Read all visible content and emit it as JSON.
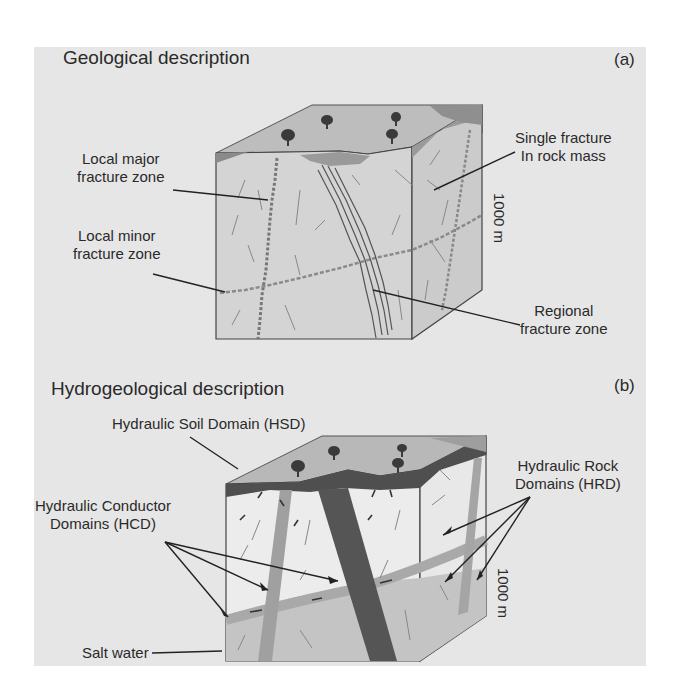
{
  "panel_a": {
    "title": "Geological description",
    "tag": "(a)",
    "labels": {
      "local_major_1": "Local major",
      "local_major_2": "fracture zone",
      "local_minor_1": "Local minor",
      "local_minor_2": "fracture zone",
      "single_1": "Single fracture",
      "single_2": "In rock mass",
      "regional_1": "Regional",
      "regional_2": "fracture zone",
      "depth": "1000 m"
    }
  },
  "panel_b": {
    "title": "Hydrogeological description",
    "tag": "(b)",
    "labels": {
      "hsd": "Hydraulic Soil Domain (HSD)",
      "hcd_1": "Hydraulic Conductor",
      "hcd_2": "Domains  (HCD)",
      "hrd_1": "Hydraulic Rock",
      "hrd_2": "Domains (HRD)",
      "salt": "Salt  water",
      "depth": "1000 m"
    }
  },
  "colors": {
    "background": "#e6e6e6",
    "block_front": "#d2d2d2",
    "block_side": "#c9c9c9",
    "top_surface": "#b5b5b5",
    "soil_dark": "#555555",
    "regional_zone_dark": "#5a5a5a",
    "salt_water": "#c4c4c4",
    "fresh_rock": "#ececec"
  }
}
